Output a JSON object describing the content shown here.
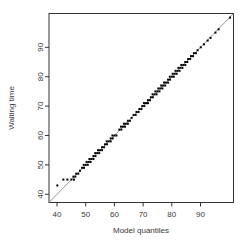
{
  "chart_data": {
    "type": "scatter",
    "title": "",
    "xlabel": "Model quantiles",
    "ylabel": "Waiting time",
    "x_ticks": [
      40,
      50,
      60,
      70,
      80,
      90
    ],
    "y_ticks": [
      40,
      50,
      60,
      70,
      80,
      90
    ],
    "xlim": [
      37.2,
      101.5
    ],
    "ylim": [
      37.2,
      101.5
    ],
    "grid": false,
    "legend": "none",
    "reference_line": {
      "type": "identity",
      "from": 37.2,
      "to": 101.5,
      "color": "#8a8a8a"
    },
    "marker": {
      "shape": "square",
      "size": 2,
      "color": "#000000"
    },
    "points": [
      [
        40.1,
        43
      ],
      [
        42.2,
        45
      ],
      [
        43.6,
        45
      ],
      [
        45.0,
        45
      ],
      [
        45.9,
        45
      ],
      [
        45.7,
        46
      ],
      [
        46.4,
        46
      ],
      [
        46.7,
        47
      ],
      [
        47.4,
        47
      ],
      [
        48,
        48
      ],
      [
        48.7,
        49
      ],
      [
        49.4,
        49
      ],
      [
        49.3,
        50
      ],
      [
        50,
        50
      ],
      [
        50.7,
        50
      ],
      [
        50.3,
        51
      ],
      [
        51,
        51
      ],
      [
        51.7,
        51
      ],
      [
        51.3,
        52
      ],
      [
        52,
        52
      ],
      [
        52.7,
        52
      ],
      [
        52.7,
        53
      ],
      [
        53.4,
        53
      ],
      [
        53.3,
        54
      ],
      [
        54,
        54
      ],
      [
        54.7,
        54
      ],
      [
        54.3,
        55
      ],
      [
        55,
        55
      ],
      [
        55.7,
        55
      ],
      [
        55.7,
        56
      ],
      [
        56.4,
        56
      ],
      [
        56.7,
        57
      ],
      [
        57.4,
        57
      ],
      [
        57.3,
        58
      ],
      [
        58,
        58
      ],
      [
        58.7,
        58
      ],
      [
        58.7,
        59
      ],
      [
        59.4,
        59
      ],
      [
        59.3,
        60
      ],
      [
        60,
        60
      ],
      [
        60.7,
        60
      ],
      [
        61.7,
        62
      ],
      [
        62.4,
        62
      ],
      [
        62.3,
        63
      ],
      [
        63,
        63
      ],
      [
        63.7,
        63
      ],
      [
        63.3,
        64
      ],
      [
        64,
        64
      ],
      [
        64.7,
        64
      ],
      [
        64.7,
        65
      ],
      [
        65.4,
        65
      ],
      [
        66,
        66
      ],
      [
        66.7,
        67
      ],
      [
        67.4,
        67
      ],
      [
        67.7,
        68
      ],
      [
        68.4,
        68
      ],
      [
        68.7,
        69
      ],
      [
        69.4,
        69
      ],
      [
        69.7,
        70
      ],
      [
        70.4,
        70
      ],
      [
        70.3,
        71
      ],
      [
        71,
        71
      ],
      [
        71.7,
        71
      ],
      [
        71.7,
        72
      ],
      [
        72.4,
        72
      ],
      [
        72.7,
        73
      ],
      [
        73.4,
        73
      ],
      [
        73.3,
        74
      ],
      [
        74,
        74
      ],
      [
        74.7,
        74
      ],
      [
        74.3,
        75
      ],
      [
        75,
        75
      ],
      [
        75.7,
        75
      ],
      [
        75.3,
        76
      ],
      [
        76,
        76
      ],
      [
        76.7,
        76
      ],
      [
        76.3,
        77
      ],
      [
        77,
        77
      ],
      [
        77.7,
        77
      ],
      [
        77.3,
        78
      ],
      [
        78,
        78
      ],
      [
        78.7,
        78
      ],
      [
        78.7,
        79
      ],
      [
        79.4,
        79
      ],
      [
        79.3,
        80
      ],
      [
        80,
        80
      ],
      [
        80.7,
        80
      ],
      [
        80.3,
        81
      ],
      [
        81,
        81
      ],
      [
        81.7,
        81
      ],
      [
        81.3,
        82
      ],
      [
        82,
        82
      ],
      [
        82.7,
        82
      ],
      [
        82.3,
        83
      ],
      [
        83,
        83
      ],
      [
        83.7,
        83
      ],
      [
        83.3,
        84
      ],
      [
        84,
        84
      ],
      [
        84.7,
        84
      ],
      [
        84.7,
        85
      ],
      [
        85.4,
        85
      ],
      [
        85.7,
        86
      ],
      [
        86.4,
        86
      ],
      [
        86.7,
        87
      ],
      [
        87.4,
        87
      ],
      [
        87.7,
        88
      ],
      [
        88.4,
        88
      ],
      [
        89,
        89
      ],
      [
        90.1,
        90
      ],
      [
        91.2,
        91
      ],
      [
        92.5,
        92.3
      ],
      [
        93.5,
        93.2
      ],
      [
        95.2,
        95
      ],
      [
        96.3,
        96.1
      ],
      [
        100.3,
        100.1
      ]
    ]
  },
  "colors": {
    "background": "#ffffff",
    "axis": "#333333",
    "tick_text": "#3a3a3a",
    "point": "#000000",
    "reference_line": "#8a8a8a"
  }
}
